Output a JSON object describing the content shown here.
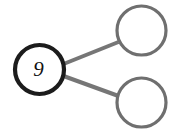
{
  "diagram": {
    "background_color": "#ffffff",
    "width": 175,
    "height": 131,
    "nodes": [
      {
        "id": "root",
        "name": "root-node",
        "label": "9",
        "cx": 39.5,
        "cy": 69.5,
        "r": 24.5,
        "stroke_color": "#1c1c1c",
        "stroke_width": 4.2,
        "fill_color": "#ffffff",
        "label_color": "#111111",
        "label_size": 21
      },
      {
        "id": "child-top",
        "name": "child-node-top",
        "label": "",
        "cx": 141.5,
        "cy": 30.5,
        "r": 24.5,
        "stroke_color": "#6f6f6f",
        "stroke_width": 3.2,
        "fill_color": "#ffffff",
        "label_color": "#111111",
        "label_size": 21
      },
      {
        "id": "child-bottom",
        "name": "child-node-bottom",
        "label": "",
        "cx": 141.5,
        "cy": 102.5,
        "r": 24.5,
        "stroke_color": "#6f6f6f",
        "stroke_width": 3.2,
        "fill_color": "#ffffff",
        "label_color": "#111111",
        "label_size": 21
      }
    ],
    "edges": [
      {
        "id": "edge-root-top",
        "name": "edge-root-to-child-top",
        "from": "root",
        "to": "child-top",
        "x1": 63.5,
        "y1": 64.0,
        "x2": 118.5,
        "y2": 42.0,
        "stroke_color": "#767676",
        "stroke_width": 4.0
      },
      {
        "id": "edge-root-bottom",
        "name": "edge-root-to-child-bottom",
        "from": "root",
        "to": "child-bottom",
        "x1": 63.5,
        "y1": 76.0,
        "x2": 118.5,
        "y2": 96.0,
        "stroke_color": "#767676",
        "stroke_width": 4.0
      }
    ]
  }
}
